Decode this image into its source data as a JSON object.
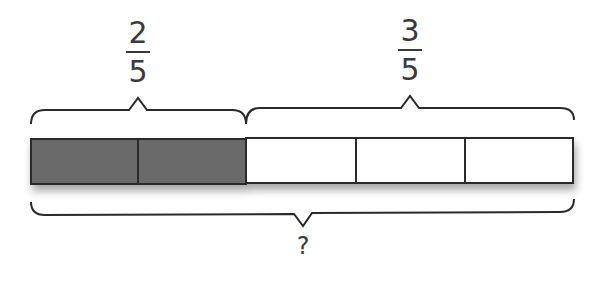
{
  "diagram": {
    "type": "tape-diagram",
    "total_parts": 5,
    "shaded_parts": 2,
    "unshaded_parts": 3,
    "colors": {
      "shaded_fill": "#6b6b6b",
      "unshaded_fill": "#ffffff",
      "stroke": "#2a2a2a",
      "text": "#3a3a3a"
    },
    "labels": {
      "left_fraction": {
        "numerator": "2",
        "denominator": "5"
      },
      "right_fraction": {
        "numerator": "3",
        "denominator": "5"
      },
      "total_label": "?"
    }
  }
}
